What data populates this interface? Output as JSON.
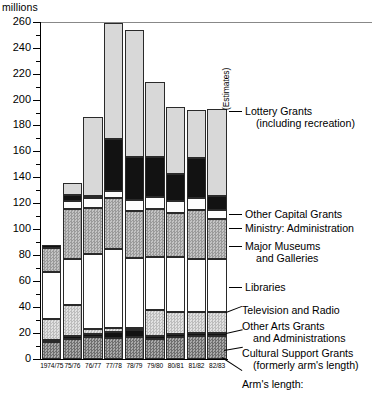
{
  "chart_data": {
    "type": "bar",
    "subtype": "stacked",
    "title": "",
    "ylabel": "millions",
    "xlabel": "",
    "ylim": [
      0,
      260
    ],
    "ytick_step_major": 20,
    "ytick_step_minor": 10,
    "grid": false,
    "legend_position": "right-callouts",
    "ytick_labels": [
      "0",
      "20",
      "40",
      "60",
      "80",
      "100",
      "120",
      "140",
      "160",
      "180",
      "200",
      "220",
      "240",
      "260"
    ],
    "categories": [
      "1974/75",
      "75/76",
      "76/77",
      "77/78",
      "78/79",
      "79/80",
      "80/81",
      "81/82",
      "82/83"
    ],
    "series": [
      {
        "name": "Cultural Support Grants (formerly arm's length)",
        "pattern": "dark-hatch",
        "values": [
          13.5,
          15.5,
          17.0,
          16.5,
          17.0,
          15.5,
          17.0,
          18.0,
          18.0
        ]
      },
      {
        "name": "Other Arts Grants and Administrations",
        "pattern": "black",
        "values": [
          1.5,
          2.0,
          2.0,
          4.0,
          5.5,
          2.0,
          2.0,
          2.0,
          2.0
        ]
      },
      {
        "name": "Television and Radio",
        "pattern": "light-hatch",
        "values": [
          15.5,
          24.0,
          4.0,
          3.5,
          1.5,
          20.5,
          17.5,
          16.0,
          16.0
        ]
      },
      {
        "name": "Libraries",
        "pattern": "white",
        "values": [
          37.0,
          36.0,
          58.0,
          60.5,
          54.0,
          40.5,
          42.0,
          41.0,
          41.0
        ]
      },
      {
        "name": "Major Museums and Galleries",
        "pattern": "mid-gray",
        "values": [
          18.5,
          38.5,
          35.5,
          39.5,
          36.5,
          37.0,
          34.5,
          38.0,
          31.0
        ]
      },
      {
        "name": "Ministry: Administration",
        "pattern": "white",
        "values": [
          0.0,
          6.0,
          7.5,
          6.0,
          8.5,
          9.5,
          9.0,
          9.0,
          7.0
        ]
      },
      {
        "name": "Other Capital Grants",
        "pattern": "black",
        "values": [
          2.0,
          4.5,
          1.5,
          40.0,
          33.0,
          30.5,
          20.5,
          31.0,
          11.0
        ]
      },
      {
        "name": "Lottery Grants (including recreation)",
        "pattern": "light-gray",
        "values": [
          0.0,
          9.0,
          61.0,
          89.0,
          98.0,
          58.0,
          52.0,
          37.0,
          67.0
        ]
      }
    ],
    "totals": [
      88.0,
      135.5,
      186.5,
      259.0,
      254.0,
      213.5,
      194.5,
      192.0,
      193.0
    ],
    "annotations": [
      {
        "text": "(Estimates)",
        "attached_to": "82/83"
      },
      {
        "text": "Arm's length:",
        "position": "below-axis-right"
      }
    ]
  },
  "axis": {
    "unit_label": "millions"
  },
  "callouts": {
    "lottery": {
      "line1": "Lottery Grants",
      "line2": "(including recreation)"
    },
    "capital": {
      "line1": "Other Capital Grants"
    },
    "ministry": {
      "line1": "Ministry: Administration"
    },
    "museums": {
      "line1": "Major Museums",
      "line2": "and Galleries"
    },
    "libraries": {
      "line1": "Libraries"
    },
    "tv": {
      "line1": "Television and Radio"
    },
    "arts": {
      "line1": "Other Arts Grants",
      "line2": "and Administrations"
    },
    "cultural": {
      "line1": "Cultural Support Grants",
      "line2": "(formerly arm's length)"
    },
    "armslength": {
      "line1": "Arm's length:"
    }
  },
  "estimates_label": "(Estimates)"
}
